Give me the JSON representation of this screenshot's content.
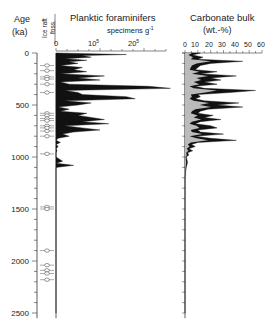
{
  "chart_data": [
    {
      "type": "area",
      "title": "Planktic foraminifers",
      "xlabel": "specimens g-1",
      "ylabel": "Age (ka)",
      "x_ticks": [
        "0",
        "10^5",
        "2.0^5"
      ],
      "x_tick_labels": [
        "0",
        "10",
        "20"
      ],
      "x_tick_exps": [
        "",
        "5",
        "5"
      ],
      "xlim": [
        0,
        250000
      ],
      "y_ticks": [
        0,
        500,
        1000,
        1500,
        2000,
        2500
      ],
      "ylim": [
        0,
        2550
      ],
      "grid": false,
      "series": [
        {
          "name": "Planktic foraminifers",
          "age": [
            0,
            15,
            25,
            40,
            55,
            70,
            85,
            100,
            120,
            140,
            160,
            180,
            200,
            220,
            240,
            260,
            280,
            300,
            320,
            340,
            360,
            380,
            400,
            420,
            440,
            460,
            480,
            500,
            520,
            540,
            560,
            580,
            600,
            620,
            640,
            660,
            680,
            700,
            720,
            740,
            760,
            780,
            800,
            820,
            840,
            860,
            880,
            900,
            920,
            940,
            960,
            980,
            1000,
            1040,
            1060,
            1080,
            1100,
            1140,
            1200,
            1500,
            2000,
            2500
          ],
          "values": [
            0,
            160000,
            60000,
            80000,
            20000,
            70000,
            30000,
            50000,
            10000,
            60000,
            40000,
            70000,
            10000,
            110000,
            50000,
            100000,
            10000,
            30000,
            210000,
            260000,
            20000,
            50000,
            60000,
            160000,
            180000,
            20000,
            80000,
            50000,
            5000,
            30000,
            10000,
            70000,
            50000,
            80000,
            110000,
            60000,
            120000,
            20000,
            60000,
            100000,
            40000,
            15000,
            30000,
            5000,
            0,
            10000,
            0,
            5000,
            0,
            2000,
            0,
            0,
            0,
            15000,
            0,
            40000,
            0,
            0,
            0,
            0,
            0,
            0
          ]
        }
      ]
    },
    {
      "type": "area",
      "title": "Carbonate bulk",
      "xlabel": "(wt.-%)",
      "ylabel": "Age (ka)",
      "x_ticks": [
        0,
        10,
        20,
        30,
        40,
        50,
        60
      ],
      "xlim": [
        0,
        60
      ],
      "y_ticks": [
        0,
        500,
        1000,
        1500,
        2000,
        2500
      ],
      "ylim": [
        0,
        2550
      ],
      "grid": false,
      "series": [
        {
          "name": "Carbonate bulk",
          "age": [
            0,
            20,
            40,
            60,
            80,
            100,
            120,
            140,
            160,
            180,
            200,
            220,
            240,
            260,
            280,
            300,
            320,
            340,
            360,
            380,
            400,
            420,
            440,
            460,
            480,
            500,
            520,
            540,
            560,
            580,
            600,
            620,
            640,
            660,
            680,
            700,
            720,
            740,
            760,
            780,
            800,
            820,
            840,
            860,
            880,
            900,
            920,
            940,
            960,
            980,
            1000,
            1050,
            1100,
            1200,
            1500,
            2000,
            2500
          ],
          "values": [
            12,
            6,
            14,
            10,
            45,
            20,
            12,
            10,
            8,
            25,
            12,
            40,
            20,
            28,
            15,
            25,
            8,
            15,
            55,
            35,
            10,
            12,
            8,
            15,
            42,
            25,
            45,
            18,
            12,
            10,
            22,
            15,
            28,
            12,
            8,
            20,
            25,
            10,
            12,
            30,
            8,
            20,
            40,
            10,
            5,
            8,
            3,
            6,
            2,
            3,
            1,
            2,
            1,
            0,
            0,
            0,
            0
          ]
        }
      ]
    }
  ],
  "labels": {
    "age": "Age",
    "age_unit": "(ka)",
    "ice_raft_line1": "Ice raft",
    "ice_raft_line2": "foss.",
    "foram_title": "Planktic foraminifers",
    "foram_unit": "specimens g",
    "foram_unit_exp": "-1",
    "carb_title": "Carbonate bulk",
    "carb_unit": "(wt.-%)"
  },
  "y_tick_labels": [
    "0",
    "500",
    "1000",
    "1500",
    "2000",
    "2500"
  ],
  "foram_ticks": [
    {
      "label": "0",
      "exp": ""
    },
    {
      "label": "10",
      "exp": "5"
    },
    {
      "label": "20",
      "exp": "5"
    }
  ],
  "carb_ticks": [
    "0",
    "10",
    "20",
    "30",
    "40",
    "50",
    "60"
  ],
  "ice_raft_ages": [
    120,
    170,
    230,
    250,
    300,
    380,
    580,
    600,
    630,
    650,
    700,
    720,
    750,
    800,
    970,
    1480,
    1500,
    1900,
    2040,
    2090,
    2120,
    2180
  ]
}
